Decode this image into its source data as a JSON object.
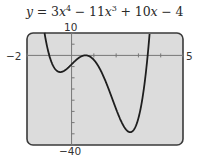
{
  "equation": {
    "y": "y",
    "eq": " = 3",
    "x1": "x",
    "p1": "4",
    "t2": " − 11",
    "x2": "x",
    "p2": "3",
    "t3": " + 10",
    "x3": "x",
    "t4": " − 4"
  },
  "labels": {
    "ymax": "10",
    "ymin": "−40",
    "xmin": "−2",
    "xmax": "5"
  },
  "colors": {
    "screen_bg": "#dcdcdc",
    "frame": "#444444",
    "curve": "#1e1e1e",
    "axis": "#777777"
  },
  "chart_data": {
    "type": "line",
    "function": "3x^4 - 11x^3 + 10x - 4",
    "xlim": [
      -2,
      5
    ],
    "ylim": [
      -40,
      10
    ],
    "xscale": 1,
    "yscale": 5,
    "grid": false,
    "xlabel": "",
    "ylabel": "",
    "tick_labels": {
      "xmin": "−2",
      "xmax": "5",
      "ymin": "−40",
      "ymax": "10"
    },
    "series": [
      {
        "name": "y = 3x^4 − 11x^3 + 10x − 4",
        "x": [
          -1.2,
          -1.0,
          -0.8,
          -0.6,
          -0.4,
          -0.2,
          0.0,
          0.2,
          0.4,
          0.6,
          0.8,
          1.0,
          1.2,
          1.4,
          1.6,
          1.8,
          2.0,
          2.2,
          2.4,
          2.6,
          2.8,
          3.0,
          3.2,
          3.4
        ],
        "values": [
          7.2,
          -4.0,
          -7.1,
          -7.6,
          -7.3,
          -5.9,
          -4.0,
          -2.1,
          -0.6,
          0.4,
          0.4,
          -2.0,
          -7.1,
          -14.9,
          -24.5,
          -31.3,
          -36.0,
          -38.5,
          -37.2,
          -34.3,
          -28.6,
          -8.0,
          1.5,
          20.4
        ]
      }
    ],
    "key_points": {
      "local_min": [
        -0.52,
        -7.7
      ],
      "local_max": [
        0.68,
        0.5
      ],
      "global_min": [
        2.63,
        -34.3
      ]
    }
  }
}
